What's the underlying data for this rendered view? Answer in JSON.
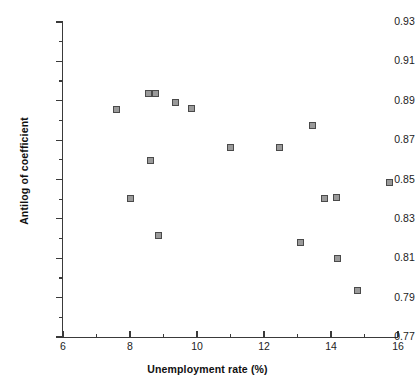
{
  "chart_data": {
    "type": "scatter",
    "title": "",
    "xlabel": "Unemployment rate (%)",
    "ylabel": "Antilog of coefficient",
    "xlim": [
      6,
      16
    ],
    "ylim": [
      0.77,
      0.93
    ],
    "grid": false,
    "legend": null,
    "x_ticks_major": [
      "6",
      "8",
      "10",
      "12",
      "14",
      "16"
    ],
    "x_ticks_major_values": [
      6,
      8,
      10,
      12,
      14,
      16
    ],
    "x_ticks_minor_values": [
      7,
      9,
      11,
      13,
      15
    ],
    "y_ticks_major": [
      "0.93",
      "0.91",
      "0.89",
      "0.87",
      "0.85",
      "0.83",
      "0.81",
      "0.79",
      "0.77"
    ],
    "y_ticks_major_values": [
      0.93,
      0.91,
      0.89,
      0.87,
      0.85,
      0.83,
      0.81,
      0.79,
      0.77
    ],
    "y_ticks_minor_values": [
      0.92,
      0.9,
      0.88,
      0.86,
      0.84,
      0.82,
      0.8,
      0.78
    ],
    "marker": {
      "shape": "square",
      "edge_color": "#4a4a4a",
      "face_color": "#9a9a9a",
      "size_px": 7
    },
    "axis_color": "#3a3a3a",
    "background": "#ffffff",
    "points": [
      {
        "x": 7.6,
        "y": 0.8855
      },
      {
        "x": 8.0,
        "y": 0.8405
      },
      {
        "x": 8.55,
        "y": 0.8935
      },
      {
        "x": 8.75,
        "y": 0.8935
      },
      {
        "x": 8.6,
        "y": 0.8595
      },
      {
        "x": 8.85,
        "y": 0.8215
      },
      {
        "x": 9.35,
        "y": 0.889
      },
      {
        "x": 9.85,
        "y": 0.886
      },
      {
        "x": 11.0,
        "y": 0.8665
      },
      {
        "x": 12.45,
        "y": 0.8665
      },
      {
        "x": 13.45,
        "y": 0.8775
      },
      {
        "x": 13.1,
        "y": 0.818
      },
      {
        "x": 13.8,
        "y": 0.8405
      },
      {
        "x": 14.2,
        "y": 0.81
      },
      {
        "x": 14.15,
        "y": 0.841
      },
      {
        "x": 14.8,
        "y": 0.7935
      },
      {
        "x": 15.75,
        "y": 0.8485
      }
    ]
  }
}
